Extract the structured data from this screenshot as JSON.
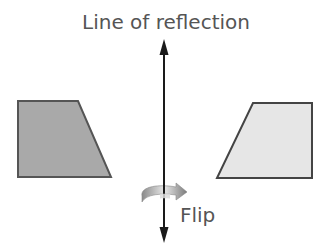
{
  "diagram": {
    "title": "Line of reflection",
    "action_label": "Flip",
    "shapes": [
      {
        "name": "original-trapezoid",
        "fill": "#a9a9a9",
        "stroke": "#555555"
      },
      {
        "name": "reflected-trapezoid",
        "fill": "#e6e6e6",
        "stroke": "#444444"
      }
    ],
    "axis_color": "#1a1a1a"
  }
}
